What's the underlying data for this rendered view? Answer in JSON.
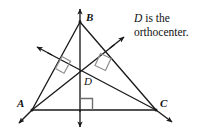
{
  "figure": {
    "name": "orthocenter-triangle-diagram",
    "background_color": "#ffffff",
    "line_color": "#1a1a1a",
    "right_angle_mark_color": "#8a8a8a"
  },
  "caption": {
    "italic_term": "D",
    "line1_rest": " is the",
    "line2": "orthocenter."
  },
  "vertices": {
    "A": {
      "label": "A",
      "x": 32,
      "y": 110
    },
    "B": {
      "label": "B",
      "x": 80,
      "y": 22
    },
    "C": {
      "label": "C",
      "x": 156,
      "y": 110
    },
    "D": {
      "label": "D",
      "x": 80,
      "y": 68
    }
  },
  "triangle": {
    "name": "triangle-ABC",
    "sides": [
      "AB",
      "BC",
      "CA"
    ]
  },
  "altitudes": [
    {
      "name": "altitude-from-B",
      "from": "B",
      "foot_on": "AC",
      "perpendicular": true
    },
    {
      "name": "altitude-from-A",
      "from": "A",
      "foot_on": "BC",
      "perpendicular": true
    },
    {
      "name": "altitude-from-C",
      "from": "C",
      "foot_on": "AB",
      "perpendicular": true
    }
  ],
  "right_angle_marks": [
    {
      "name": "right-angle-on-AB",
      "at_side": "AB"
    },
    {
      "name": "right-angle-on-BC",
      "at_side": "BC"
    },
    {
      "name": "right-angle-on-AC",
      "at_side": "AC"
    }
  ],
  "arrowheads": [
    {
      "name": "arrow-up-B",
      "direction": "up"
    },
    {
      "name": "arrow-down-B",
      "direction": "down"
    },
    {
      "name": "arrow-up-right-A",
      "direction": "up-right"
    },
    {
      "name": "arrow-down-left-A",
      "direction": "down-left"
    },
    {
      "name": "arrow-up-left-C",
      "direction": "up-left"
    },
    {
      "name": "arrow-down-right-C",
      "direction": "down-right"
    }
  ]
}
